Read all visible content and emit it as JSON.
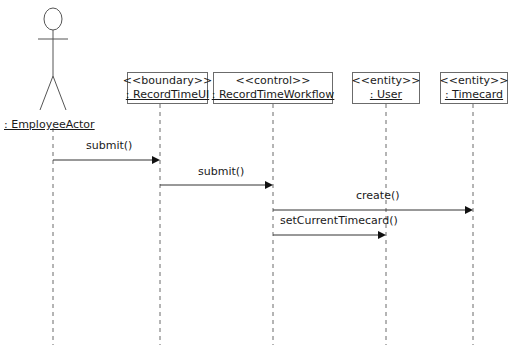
{
  "diagram": {
    "type": "UML sequence diagram",
    "actor": {
      "name": ": EmployeeActor",
      "x": 53
    },
    "participants": [
      {
        "stereotype": "<<boundary>>",
        "name": ": RecordTimeUI",
        "x": 160,
        "left": 127,
        "width": 81
      },
      {
        "stereotype": "<<control>>",
        "name": ": RecordTimeWorkflow",
        "x": 273,
        "left": 213,
        "width": 120
      },
      {
        "stereotype": "<<entity>>",
        "name": ": User",
        "x": 386,
        "left": 352,
        "width": 68
      },
      {
        "stereotype": "<<entity>>",
        "name": ": Timecard",
        "x": 473,
        "left": 440,
        "width": 68
      }
    ],
    "messages": [
      {
        "label": "submit()",
        "from": ": EmployeeActor",
        "to": ": RecordTimeUI",
        "y": 160
      },
      {
        "label": "submit()",
        "from": ": RecordTimeUI",
        "to": ": RecordTimeWorkflow",
        "y": 185
      },
      {
        "label": "create()",
        "from": ": RecordTimeWorkflow",
        "to": ": Timecard",
        "y": 210
      },
      {
        "label": "setCurrentTimecard()",
        "from": ": RecordTimeWorkflow",
        "to": ": User",
        "y": 235
      }
    ],
    "colors": {
      "line": "#6b6b6b",
      "arrow": "#1a1a1a",
      "text": "#1a1a1a",
      "background": "#ffffff"
    }
  }
}
